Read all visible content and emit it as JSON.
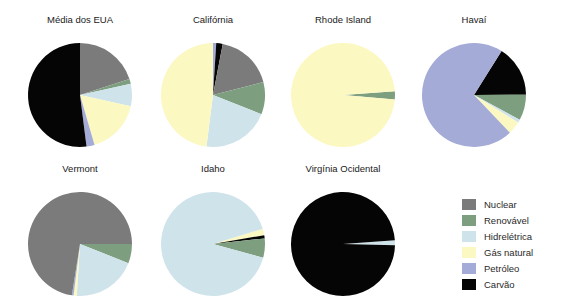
{
  "chart_data": {
    "type": "pie",
    "title": "",
    "categories": [
      "Nuclear",
      "Renovável",
      "Hidrelétrica",
      "Gás natural",
      "Petróleo",
      "Carvão"
    ],
    "colors": {
      "Nuclear": "#7b7b7b",
      "Renovável": "#7e9e80",
      "Hidrelétrica": "#cfe3ea",
      "Gás natural": "#fbf8c2",
      "Petróleo": "#a3abd6",
      "Carvão": "#050505"
    },
    "charts": [
      {
        "title": "Média dos EUA",
        "slices": [
          {
            "label": "Nuclear",
            "value": 20
          },
          {
            "label": "Renovável",
            "value": 1.5
          },
          {
            "label": "Hidrelétrica",
            "value": 7
          },
          {
            "label": "Gás natural",
            "value": 17
          },
          {
            "label": "Petróleo",
            "value": 2.5
          },
          {
            "label": "Carvão",
            "value": 52
          }
        ]
      },
      {
        "title": "Califórnia",
        "slices": [
          {
            "label": "Petróleo",
            "value": 1
          },
          {
            "label": "Carvão",
            "value": 2
          },
          {
            "label": "Nuclear",
            "value": 18
          },
          {
            "label": "Renovável",
            "value": 10
          },
          {
            "label": "Hidrelétrica",
            "value": 21
          },
          {
            "label": "Gás natural",
            "value": 48
          }
        ]
      },
      {
        "title": "Rhode Island",
        "start_angle": 86,
        "slices": [
          {
            "label": "Renovável",
            "value": 2.5
          },
          {
            "label": "Gás natural",
            "value": 97.5
          }
        ]
      },
      {
        "title": "Havaí",
        "start_angle": 32,
        "slices": [
          {
            "label": "Carvão",
            "value": 16
          },
          {
            "label": "Renovável",
            "value": 8
          },
          {
            "label": "Hidrelétrica",
            "value": 1
          },
          {
            "label": "Gás natural",
            "value": 4
          },
          {
            "label": "Petróleo",
            "value": 71
          }
        ]
      },
      {
        "title": "Vermont",
        "start_angle": 90,
        "slices": [
          {
            "label": "Renovável",
            "value": 6
          },
          {
            "label": "Hidrelétrica",
            "value": 20
          },
          {
            "label": "Gás natural",
            "value": 1
          },
          {
            "label": "Petróleo",
            "value": 0.5
          },
          {
            "label": "Nuclear",
            "value": 72.5
          }
        ]
      },
      {
        "title": "Idaho",
        "start_angle": 73,
        "slices": [
          {
            "label": "Gás natural",
            "value": 2
          },
          {
            "label": "Carvão",
            "value": 1
          },
          {
            "label": "Renovável",
            "value": 6
          },
          {
            "label": "Hidrelétrica",
            "value": 91
          }
        ]
      },
      {
        "title": "Virgínia Ocidental",
        "start_angle": 86,
        "slices": [
          {
            "label": "Hidrelétrica",
            "value": 1.5
          },
          {
            "label": "Carvão",
            "value": 98.5
          }
        ]
      }
    ],
    "legend_position": "bottom-right"
  },
  "legend": {
    "items": [
      {
        "label": "Nuclear",
        "color": "#7b7b7b"
      },
      {
        "label": "Renovável",
        "color": "#7e9e80"
      },
      {
        "label": "Hidrelétrica",
        "color": "#cfe3ea"
      },
      {
        "label": "Gás natural",
        "color": "#fbf8c2"
      },
      {
        "label": "Petróleo",
        "color": "#a3abd6"
      },
      {
        "label": "Carvão",
        "color": "#050505"
      }
    ]
  }
}
